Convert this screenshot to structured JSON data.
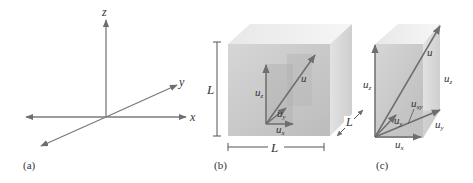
{
  "panels": [
    {
      "id": "a",
      "caption": "(a)",
      "axes": {
        "x": "x",
        "y": "y",
        "z": "z"
      }
    },
    {
      "id": "b",
      "caption": "(b)",
      "vector": "u",
      "components": {
        "x": "u",
        "x_sub": "x",
        "y": "u",
        "y_sub": "y",
        "z": "u",
        "z_sub": "z"
      },
      "dimensions": {
        "height": "L",
        "width": "L",
        "depth": "L"
      }
    },
    {
      "id": "c",
      "caption": "(c)",
      "vector": "u",
      "components": {
        "x": "u",
        "x_sub": "x",
        "y": "u",
        "y_sub": "y",
        "z": "u",
        "z_sub": "z",
        "xy": "u",
        "xy_sub": "xy"
      },
      "side_labels": {
        "z": "u",
        "z_sub": "z",
        "y": "u",
        "y_sub": "y"
      }
    }
  ],
  "colors": {
    "line": "#7a7a7a",
    "box_front": "#c8c8c8",
    "box_top": "#e6e6e6",
    "box_side": "#d4d4d4",
    "inner": "#b4b4b4",
    "vector": "#6e6e6e"
  }
}
